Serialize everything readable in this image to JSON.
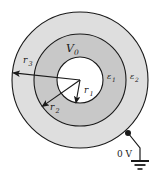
{
  "figure": {
    "background_color": "#ffffff",
    "stroke_color": "#1a1a1a",
    "center": {
      "x": 80,
      "y": 80
    }
  },
  "regions": [
    {
      "name": "inner-core",
      "label": "",
      "radius_px": 23,
      "fill": "#ffffff",
      "description": "inner conductor region"
    },
    {
      "name": "middle-shell",
      "label": "ε₁",
      "radius_px": 46,
      "fill": "#c8c8c8",
      "description": "first dielectric shell"
    },
    {
      "name": "outer-shell",
      "label": "ε₂",
      "radius_px": 68,
      "fill": "#dedede",
      "description": "second dielectric shell"
    }
  ],
  "labels": {
    "potential": "V",
    "potential_sub": "0",
    "r1": "r",
    "r1_sub": "1",
    "r2": "r",
    "r2_sub": "2",
    "r3": "r",
    "r3_sub": "3",
    "eps1": "ε",
    "eps1_sub": "1",
    "eps2": "ε",
    "eps2_sub": "2",
    "ground_voltage": "0 V"
  },
  "radii_arrows": [
    {
      "name": "r1",
      "label": "r₁",
      "angle_deg": 100,
      "length_px": 23
    },
    {
      "name": "r2",
      "label": "r₂",
      "angle_deg": 145,
      "length_px": 46
    },
    {
      "name": "r3",
      "label": "r₃",
      "angle_deg": 186,
      "length_px": 68
    }
  ],
  "ground": {
    "node_label": "0 V",
    "node_x": 128,
    "node_y": 133,
    "wire_x": 140,
    "wire_bottom_y": 160,
    "symbol": "earth-ground"
  }
}
